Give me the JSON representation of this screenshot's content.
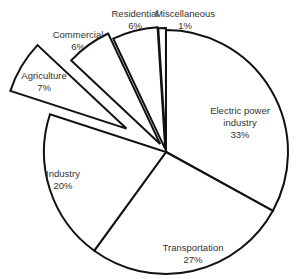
{
  "chart_data": {
    "type": "pie",
    "title": "",
    "start_angle_deg": -90,
    "direction": "clockwise",
    "center": [
      166,
      152
    ],
    "radius": 122,
    "slices": [
      {
        "label": "Electric power industry",
        "label_lines": [
          "Electric power",
          "industry"
        ],
        "value": 33,
        "pct_text": "33%",
        "explode": 0,
        "label_pos": [
          240,
          105
        ]
      },
      {
        "label": "Transportation",
        "label_lines": [
          "Transportation"
        ],
        "value": 27,
        "pct_text": "27%",
        "explode": 0,
        "label_pos": [
          193,
          242
        ]
      },
      {
        "label": "Industry",
        "label_lines": [
          "Industry"
        ],
        "value": 20,
        "pct_text": "20%",
        "explode": 0,
        "label_pos": [
          63,
          168
        ]
      },
      {
        "label": "Agriculture",
        "label_lines": [
          "Agriculture"
        ],
        "value": 7,
        "pct_text": "7%",
        "explode": 46,
        "label_pos": [
          44,
          70
        ]
      },
      {
        "label": "Commercial",
        "label_lines": [
          "Commercial"
        ],
        "value": 6,
        "pct_text": "6%",
        "explode": 10,
        "label_pos": [
          78,
          29
        ]
      },
      {
        "label": "Residential",
        "label_lines": [
          "Residential"
        ],
        "value": 6,
        "pct_text": "6%",
        "explode": 3,
        "label_pos": [
          135,
          8
        ]
      },
      {
        "label": "Miscellaneous",
        "label_lines": [
          "Miscellaneous"
        ],
        "value": 1,
        "pct_text": "1%",
        "explode": 2,
        "label_pos": [
          185,
          8
        ]
      }
    ],
    "categories": [
      "Electric power industry",
      "Transportation",
      "Industry",
      "Agriculture",
      "Commercial",
      "Residential",
      "Miscellaneous"
    ],
    "values": [
      33,
      27,
      20,
      7,
      6,
      6,
      1
    ],
    "unit": "%",
    "legend": "none (data labels on slices)",
    "colors": {
      "fill": "#ffffff",
      "stroke": "#111111",
      "text": "#333333"
    }
  }
}
